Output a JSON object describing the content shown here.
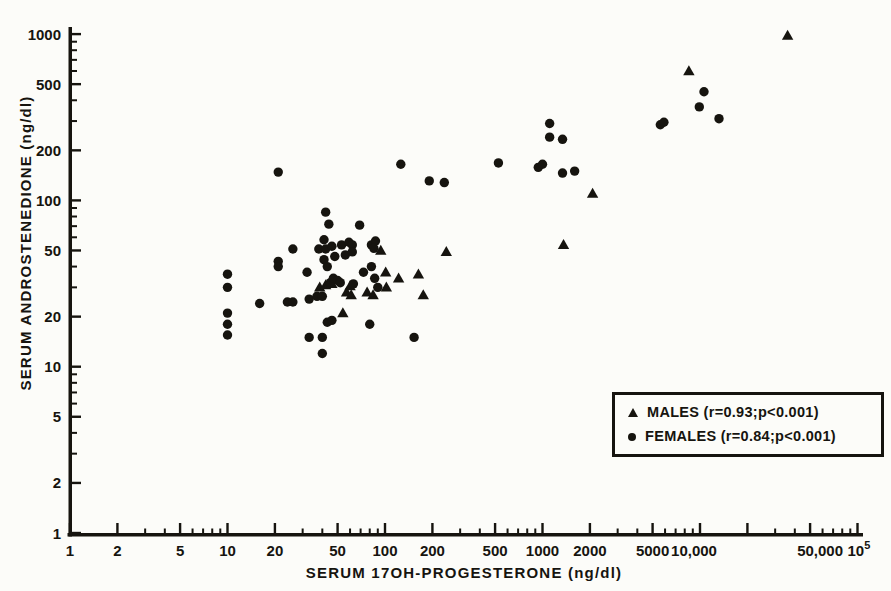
{
  "page": {
    "background": "#fcfcf9",
    "ink": "#16140f"
  },
  "chart_data": {
    "type": "scatter",
    "title": "",
    "grid": false,
    "x_axis": {
      "label": "SERUM 17OH-PROGESTERONE (ng/dl)",
      "scale": "log",
      "range": [
        1,
        100000
      ],
      "ticks": [
        {
          "v": 1,
          "label": "1"
        },
        {
          "v": 2,
          "label": "2"
        },
        {
          "v": 5,
          "label": "5"
        },
        {
          "v": 10,
          "label": "10"
        },
        {
          "v": 20,
          "label": "20"
        },
        {
          "v": 50,
          "label": "50"
        },
        {
          "v": 100,
          "label": "100"
        },
        {
          "v": 200,
          "label": "200"
        },
        {
          "v": 500,
          "label": "500"
        },
        {
          "v": 1000,
          "label": "1000"
        },
        {
          "v": 2000,
          "label": "2000"
        },
        {
          "v": 5000,
          "label": "5000"
        },
        {
          "v": 10000,
          "label": "10,000",
          "dx": -6
        },
        {
          "v": 20000,
          "label": ""
        },
        {
          "v": 50000,
          "label": "50,000",
          "dx": 10
        },
        {
          "v": 100000,
          "label": "10",
          "sup": "5",
          "dx": 6
        }
      ],
      "minor_ticks": [
        3,
        4,
        6,
        7,
        8,
        9,
        30,
        40,
        60,
        70,
        80,
        90,
        300,
        400,
        600,
        700,
        800,
        900,
        3000,
        4000,
        6000,
        7000,
        8000,
        9000,
        30000,
        40000,
        60000,
        70000,
        80000,
        90000
      ]
    },
    "y_axis": {
      "label": "SERUM ANDROSTENEDIONE (ng/dl)",
      "scale": "log",
      "range": [
        1,
        1000
      ],
      "ticks": [
        {
          "v": 1,
          "label": "1"
        },
        {
          "v": 2,
          "label": "2"
        },
        {
          "v": 5,
          "label": "5"
        },
        {
          "v": 10,
          "label": "10"
        },
        {
          "v": 20,
          "label": "20"
        },
        {
          "v": 50,
          "label": "50"
        },
        {
          "v": 100,
          "label": "100"
        },
        {
          "v": 200,
          "label": "200"
        },
        {
          "v": 500,
          "label": "500"
        },
        {
          "v": 1000,
          "label": "1000"
        }
      ],
      "minor_ticks": [
        3,
        4,
        6,
        7,
        8,
        9,
        30,
        40,
        60,
        70,
        80,
        90,
        300,
        400,
        600,
        700,
        800,
        900
      ]
    },
    "legend": {
      "position": "lower-right"
    },
    "series": [
      {
        "name": "MALES",
        "marker": "triangle",
        "legend_label": "MALES (r=0.93;p<0.001)",
        "r": "0.93",
        "p": "<0.001",
        "points": [
          [
            38.5,
            30
          ],
          [
            42,
            31
          ],
          [
            46,
            31.5
          ],
          [
            54,
            21
          ],
          [
            57,
            28
          ],
          [
            61,
            27
          ],
          [
            60,
            30.5
          ],
          [
            77,
            28
          ],
          [
            84,
            27
          ],
          [
            94,
            50
          ],
          [
            101,
            37
          ],
          [
            102,
            30
          ],
          [
            122,
            34
          ],
          [
            163,
            36
          ],
          [
            175,
            27
          ],
          [
            245,
            49
          ],
          [
            1360,
            54
          ],
          [
            2080,
            110
          ],
          [
            8500,
            600
          ],
          [
            36000,
            980
          ]
        ]
      },
      {
        "name": "FEMALES",
        "marker": "circle",
        "legend_label": "FEMALES (r=0.84;p<0.001)",
        "r": "0.84",
        "p": "<0.001",
        "points": [
          [
            10,
            36
          ],
          [
            10,
            30
          ],
          [
            10,
            21
          ],
          [
            10,
            18
          ],
          [
            10,
            15.5
          ],
          [
            16,
            24
          ],
          [
            21,
            148
          ],
          [
            21,
            43
          ],
          [
            21,
            40
          ],
          [
            24,
            24.5
          ],
          [
            26,
            24.5
          ],
          [
            26,
            51
          ],
          [
            32,
            37
          ],
          [
            33,
            25.5
          ],
          [
            37,
            26.5
          ],
          [
            40,
            26.5
          ],
          [
            33,
            15
          ],
          [
            40,
            15
          ],
          [
            40,
            12
          ],
          [
            38,
            51
          ],
          [
            41,
            58
          ],
          [
            42,
            51
          ],
          [
            46,
            53
          ],
          [
            41,
            44
          ],
          [
            43,
            40
          ],
          [
            48,
            46
          ],
          [
            42,
            85
          ],
          [
            44,
            72
          ],
          [
            43,
            18.5
          ],
          [
            46,
            19
          ],
          [
            45,
            32
          ],
          [
            47,
            34
          ],
          [
            50,
            33
          ],
          [
            52,
            32
          ],
          [
            53,
            54
          ],
          [
            56,
            47
          ],
          [
            59,
            56
          ],
          [
            62,
            54
          ],
          [
            62,
            49
          ],
          [
            63,
            31.5
          ],
          [
            69,
            71
          ],
          [
            73,
            37
          ],
          [
            80,
            18
          ],
          [
            82,
            40
          ],
          [
            82,
            54
          ],
          [
            87,
            57
          ],
          [
            85,
            51.5
          ],
          [
            86,
            34
          ],
          [
            90,
            30
          ],
          [
            126,
            165
          ],
          [
            153,
            15
          ],
          [
            191,
            131
          ],
          [
            238,
            128
          ],
          [
            525,
            168
          ],
          [
            940,
            158
          ],
          [
            1000,
            165
          ],
          [
            1110,
            290
          ],
          [
            1110,
            240
          ],
          [
            1340,
            233
          ],
          [
            1340,
            146
          ],
          [
            1600,
            150
          ],
          [
            5600,
            285
          ],
          [
            5900,
            295
          ],
          [
            9900,
            365
          ],
          [
            10600,
            450
          ],
          [
            13200,
            310
          ]
        ]
      }
    ]
  }
}
